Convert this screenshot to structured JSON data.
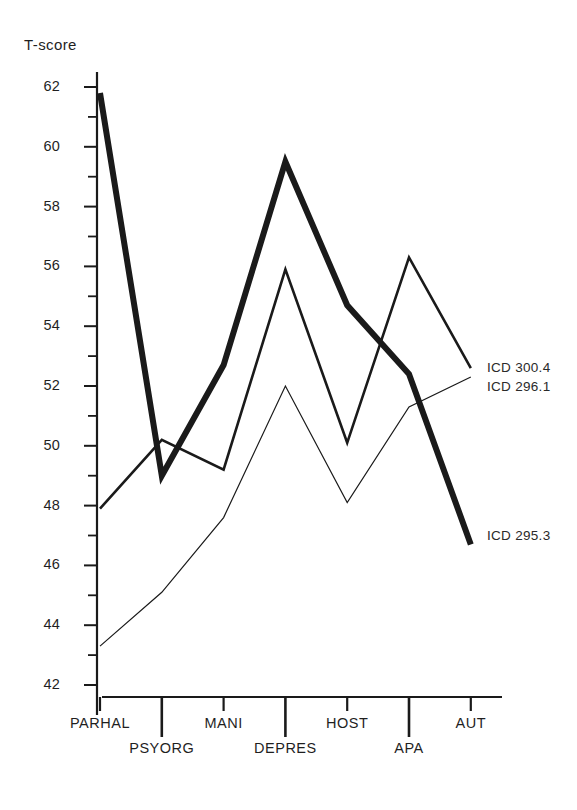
{
  "chart_data": {
    "type": "line",
    "title": "",
    "xlabel": "",
    "ylabel": "T-score",
    "ylim": [
      41,
      63
    ],
    "yticks": [
      42,
      44,
      46,
      48,
      50,
      52,
      54,
      56,
      58,
      60,
      62
    ],
    "yticks_minor": [
      43,
      45,
      47,
      49,
      51,
      53,
      55,
      57,
      59,
      61
    ],
    "grid": false,
    "legend_position": "right-inline",
    "categories": [
      "PARHAL",
      "PSYORG",
      "MANI",
      "DEPRES",
      "HOST",
      "APA",
      "AUT"
    ],
    "series": [
      {
        "name": "ICD 295.3",
        "style": "thick",
        "color": "#1a1a1a",
        "width": 6,
        "values": [
          61.8,
          49.0,
          52.7,
          59.5,
          54.7,
          52.4,
          46.7
        ]
      },
      {
        "name": "ICD 296.1",
        "style": "medium",
        "color": "#1a1a1a",
        "width": 2.6,
        "values": [
          47.9,
          50.2,
          49.2,
          55.9,
          50.1,
          56.3,
          52.6
        ]
      },
      {
        "name": "ICD 300.4",
        "style": "thin",
        "color": "#1a1a1a",
        "width": 1.2,
        "values": [
          43.3,
          45.1,
          47.6,
          52.0,
          48.1,
          51.3,
          52.3
        ]
      }
    ],
    "annotations": [
      {
        "text": "ICD 300.4",
        "x": 487,
        "y": 369
      },
      {
        "text": "ICD 296.1",
        "x": 487,
        "y": 388
      },
      {
        "text": "ICD 295.3",
        "x": 487,
        "y": 537
      }
    ]
  }
}
